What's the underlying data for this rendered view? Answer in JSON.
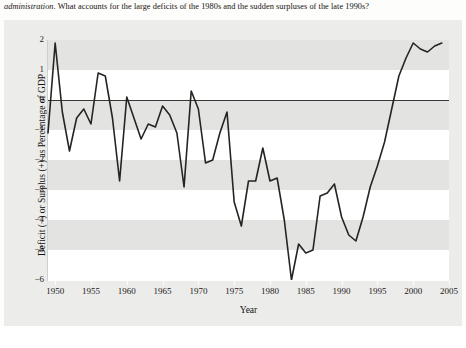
{
  "caption": {
    "italic_lead": "administration",
    "rest": ". What accounts for the large deficits of the 1980s and the sudden surpluses of the late 1990s?"
  },
  "chart_data": {
    "type": "line",
    "title": "",
    "xlabel": "Year",
    "ylabel": "Deficit (−) or Surplus (+) as Percentage of GDP",
    "xlim": [
      1949,
      2005
    ],
    "ylim": [
      -6,
      2
    ],
    "xticks": [
      1950,
      1955,
      1960,
      1965,
      1970,
      1975,
      1980,
      1985,
      1990,
      1995,
      2000,
      2005
    ],
    "yticks": [
      2,
      1,
      0,
      -1,
      -2,
      -3,
      -4,
      -5,
      -6
    ],
    "grid": "alternating-horizontal-bands",
    "legend": "none",
    "zero_line": 0,
    "line_color": "#262422",
    "band_color": "#e3e3e2",
    "x": [
      1949,
      1950,
      1951,
      1952,
      1953,
      1954,
      1955,
      1956,
      1957,
      1958,
      1959,
      1960,
      1961,
      1962,
      1963,
      1964,
      1965,
      1966,
      1967,
      1968,
      1969,
      1970,
      1971,
      1972,
      1973,
      1974,
      1975,
      1976,
      1977,
      1978,
      1979,
      1980,
      1981,
      1982,
      1983,
      1984,
      1985,
      1986,
      1987,
      1988,
      1989,
      1990,
      1991,
      1992,
      1993,
      1994,
      1995,
      1996,
      1997,
      1998,
      1999,
      2000,
      2001,
      2002,
      2003,
      2004
    ],
    "values": [
      -1.1,
      1.9,
      -0.4,
      -1.7,
      -0.6,
      -0.3,
      -0.8,
      0.9,
      0.8,
      -0.6,
      -2.7,
      0.1,
      -0.6,
      -1.3,
      -0.8,
      -0.9,
      -0.2,
      -0.5,
      -1.1,
      -2.9,
      0.3,
      -0.3,
      -2.1,
      -2.0,
      -1.1,
      -0.4,
      -3.4,
      -4.2,
      -2.7,
      -2.7,
      -1.6,
      -2.7,
      -2.6,
      -4.0,
      -6.0,
      -4.8,
      -5.1,
      -5.0,
      -3.2,
      -3.1,
      -2.8,
      -3.9,
      -4.5,
      -4.7,
      -3.9,
      -2.9,
      -2.2,
      -1.4,
      -0.3,
      0.8,
      1.4,
      1.9,
      1.7,
      1.6,
      1.8,
      1.9
    ],
    "annotations": [
      {
        "text": "largest deficit near 1983, about −6 percent of GDP"
      },
      {
        "text": "surpluses in the late 1990s through 2004"
      }
    ]
  }
}
